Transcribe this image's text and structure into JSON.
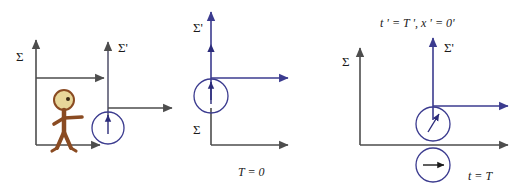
{
  "figure": {
    "background_color": "#ffffff"
  },
  "colors": {
    "frame_sigma_axis": "#4d4d4d",
    "frame_sigma_prime_axis": "#3b3b8f",
    "clock_outline_primed": "#3b3b8f",
    "clock_outline_unprimed": "#3b3b8f",
    "clock_hand_primed": "#2b2b7a",
    "clock_hand_unprimed": "#1a1a1a",
    "observer_body": "#8a4b22",
    "observer_head_fill": "#e8d79a",
    "observer_head_stroke": "#8a4b22",
    "observer_eye": "#3a2a14",
    "text": "#1a1a1a"
  },
  "panels": [
    {
      "id": "panel-left",
      "name": "observer-and-moving-frame",
      "labels": {
        "sigma": "Σ",
        "sigma_prime": "Σ'",
        "caption": ""
      },
      "elements": {
        "observer_name": "stick-figure-observer",
        "clock_name": "clock-primed",
        "velocity_arrow_upper": "velocity-arrow-upper",
        "velocity_arrow_lower": "velocity-arrow-lower",
        "clock_hand_direction": "up"
      }
    },
    {
      "id": "panel-middle",
      "name": "frames-coincident-at-t-zero",
      "labels": {
        "sigma": "Σ",
        "sigma_prime": "Σ'",
        "caption": "T = 0"
      },
      "elements": {
        "clock_name": "clock-primed",
        "clock_hand_direction": "up"
      }
    },
    {
      "id": "panel-right",
      "name": "frames-after-elapsed-time",
      "labels": {
        "sigma": "Σ",
        "sigma_prime": "Σ'",
        "caption": "t = T",
        "annotation": "t ' = T ', x ' = 0'"
      },
      "elements": {
        "clock_primed_name": "clock-primed",
        "clock_unprimed_name": "clock-unprimed",
        "clock_primed_hand_direction": "up-right",
        "clock_unprimed_hand_direction": "right"
      }
    }
  ]
}
